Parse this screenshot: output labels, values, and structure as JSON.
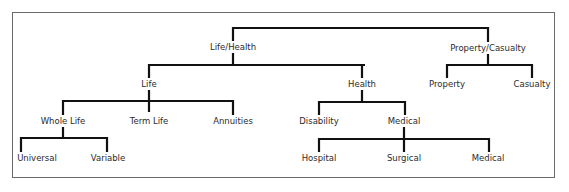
{
  "diagram": {
    "type": "tree",
    "nodes": [
      {
        "id": "life_health",
        "label": "Life/Health",
        "x": 233,
        "y": 47,
        "parent": null
      },
      {
        "id": "property_casualty",
        "label": "Property/Casualty",
        "x": 488,
        "y": 48,
        "parent": null
      },
      {
        "id": "life",
        "label": "Life",
        "x": 149,
        "y": 84,
        "parent": "life_health"
      },
      {
        "id": "health",
        "label": "Health",
        "x": 362,
        "y": 84,
        "parent": "life_health"
      },
      {
        "id": "property",
        "label": "Property",
        "x": 447,
        "y": 84,
        "parent": "property_casualty"
      },
      {
        "id": "casualty",
        "label": "Casualty",
        "x": 532,
        "y": 84,
        "parent": "property_casualty"
      },
      {
        "id": "whole_life",
        "label": "Whole Life",
        "x": 63,
        "y": 121,
        "parent": "life"
      },
      {
        "id": "term_life",
        "label": "Term Life",
        "x": 149,
        "y": 121,
        "parent": "life"
      },
      {
        "id": "annuities",
        "label": "Annuities",
        "x": 233,
        "y": 121,
        "parent": "life"
      },
      {
        "id": "disability",
        "label": "Disability",
        "x": 319,
        "y": 121,
        "parent": "health"
      },
      {
        "id": "medical_group",
        "label": "Medical",
        "x": 404,
        "y": 121,
        "parent": "health"
      },
      {
        "id": "universal",
        "label": "Universal",
        "x": 37,
        "y": 158,
        "parent": "whole_life"
      },
      {
        "id": "variable",
        "label": "Variable",
        "x": 108,
        "y": 158,
        "parent": "whole_life"
      },
      {
        "id": "hospital",
        "label": "Hospital",
        "x": 319,
        "y": 158,
        "parent": "medical_group"
      },
      {
        "id": "surgical",
        "label": "Surgical",
        "x": 404,
        "y": 158,
        "parent": "medical_group"
      },
      {
        "id": "medical",
        "label": "Medical",
        "x": 488,
        "y": 158,
        "parent": "medical_group"
      }
    ],
    "lines": [
      {
        "x1": 233,
        "y1": 28,
        "x2": 488,
        "y2": 28
      },
      {
        "x1": 233,
        "y1": 27,
        "x2": 233,
        "y2": 41
      },
      {
        "x1": 488,
        "y1": 27,
        "x2": 488,
        "y2": 42
      },
      {
        "x1": 233,
        "y1": 53,
        "x2": 233,
        "y2": 65
      },
      {
        "x1": 149,
        "y1": 65,
        "x2": 365,
        "y2": 65
      },
      {
        "x1": 149,
        "y1": 64,
        "x2": 149,
        "y2": 78
      },
      {
        "x1": 362,
        "y1": 64,
        "x2": 362,
        "y2": 78
      },
      {
        "x1": 488,
        "y1": 54,
        "x2": 488,
        "y2": 65
      },
      {
        "x1": 447,
        "y1": 65,
        "x2": 532,
        "y2": 65
      },
      {
        "x1": 447,
        "y1": 64,
        "x2": 447,
        "y2": 78
      },
      {
        "x1": 532,
        "y1": 64,
        "x2": 532,
        "y2": 78
      },
      {
        "x1": 149,
        "y1": 90,
        "x2": 149,
        "y2": 112
      },
      {
        "x1": 63,
        "y1": 101,
        "x2": 233,
        "y2": 101
      },
      {
        "x1": 63,
        "y1": 100,
        "x2": 63,
        "y2": 115
      },
      {
        "x1": 233,
        "y1": 100,
        "x2": 233,
        "y2": 115
      },
      {
        "x1": 362,
        "y1": 90,
        "x2": 362,
        "y2": 102
      },
      {
        "x1": 319,
        "y1": 102,
        "x2": 405,
        "y2": 102
      },
      {
        "x1": 319,
        "y1": 101,
        "x2": 319,
        "y2": 115
      },
      {
        "x1": 405,
        "y1": 101,
        "x2": 405,
        "y2": 115
      },
      {
        "x1": 63,
        "y1": 127,
        "x2": 63,
        "y2": 138
      },
      {
        "x1": 21,
        "y1": 138,
        "x2": 107,
        "y2": 138
      },
      {
        "x1": 21,
        "y1": 137,
        "x2": 21,
        "y2": 152
      },
      {
        "x1": 107,
        "y1": 137,
        "x2": 107,
        "y2": 152
      },
      {
        "x1": 404,
        "y1": 127,
        "x2": 404,
        "y2": 152
      },
      {
        "x1": 319,
        "y1": 139,
        "x2": 489,
        "y2": 139
      },
      {
        "x1": 319,
        "y1": 138,
        "x2": 319,
        "y2": 152
      },
      {
        "x1": 489,
        "y1": 138,
        "x2": 489,
        "y2": 152
      }
    ],
    "colors": {
      "line": "#111111",
      "text": "#2b2b2b",
      "border": "#6a6a6a"
    }
  }
}
